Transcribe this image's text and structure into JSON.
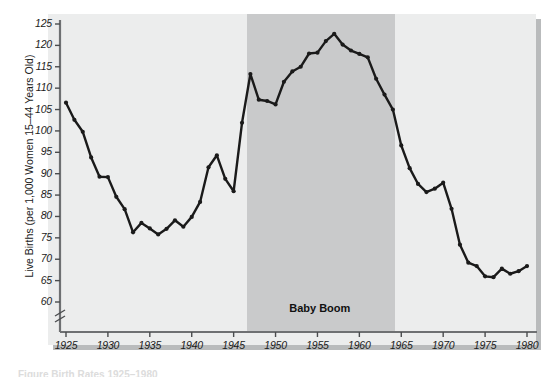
{
  "chart_data": {
    "type": "line",
    "title": "",
    "xlabel": "",
    "ylabel": "Live Births (per 1,000 Women 15–44 Years Old)",
    "xlim": [
      1924,
      1981
    ],
    "ylim": [
      57,
      125
    ],
    "axis_break": true,
    "grid": false,
    "legend": "none",
    "x": [
      1925,
      1926,
      1927,
      1928,
      1929,
      1930,
      1931,
      1932,
      1933,
      1934,
      1935,
      1936,
      1937,
      1938,
      1939,
      1940,
      1941,
      1942,
      1943,
      1944,
      1945,
      1946,
      1947,
      1948,
      1949,
      1950,
      1951,
      1952,
      1953,
      1954,
      1955,
      1956,
      1957,
      1958,
      1959,
      1960,
      1961,
      1962,
      1963,
      1964,
      1965,
      1966,
      1967,
      1968,
      1969,
      1970,
      1971,
      1972,
      1973,
      1974,
      1975,
      1976,
      1977,
      1978,
      1979,
      1980
    ],
    "values": [
      106.6,
      102.6,
      99.8,
      93.8,
      89.3,
      89.2,
      84.6,
      81.7,
      76.3,
      78.5,
      77.2,
      75.8,
      77.1,
      79.1,
      77.6,
      79.9,
      83.4,
      91.5,
      94.3,
      88.8,
      85.9,
      101.9,
      113.3,
      107.3,
      107.0,
      106.2,
      111.5,
      113.9,
      115.0,
      118.1,
      118.3,
      121.0,
      122.7,
      120.2,
      118.8,
      118.0,
      117.2,
      112.2,
      108.5,
      105.0,
      96.6,
      91.3,
      87.6,
      85.7,
      86.5,
      87.9,
      81.8,
      73.4,
      69.2,
      68.4,
      66.0,
      65.8,
      67.8,
      66.6,
      67.2,
      68.4
    ],
    "yticks": [
      60,
      65,
      70,
      75,
      80,
      85,
      90,
      95,
      100,
      105,
      110,
      115,
      120,
      125
    ],
    "xticks": [
      1925,
      1930,
      1935,
      1940,
      1945,
      1950,
      1955,
      1960,
      1965,
      1970,
      1975,
      1980
    ],
    "shaded_region": {
      "label": "Baby Boom",
      "x_start": 1946.6,
      "x_end": 1964.3,
      "color": "#c9cacb"
    },
    "line_color": "#1a1a1a",
    "marker": "circle",
    "plot_background": "#eceded"
  },
  "figure": {
    "cut_caption": "Figure    Birth Rates 1925–1980"
  }
}
